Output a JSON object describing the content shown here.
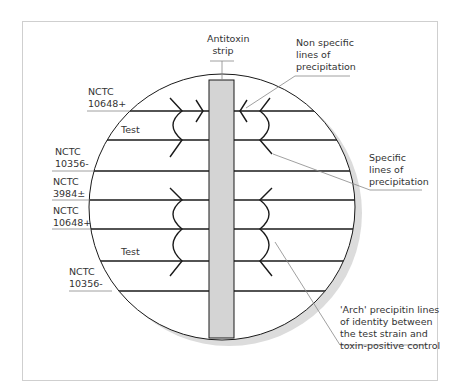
{
  "diagram": {
    "type": "immunodiffusion-plate",
    "strip_label": [
      "Antitoxin",
      "strip"
    ],
    "left_labels": [
      {
        "id": "nctc-10648-top",
        "lines": [
          "NCTC",
          "10648+"
        ]
      },
      {
        "id": "test-top",
        "lines": [
          "Test"
        ]
      },
      {
        "id": "nctc-10356-top",
        "lines": [
          "NCTC",
          "10356-"
        ]
      },
      {
        "id": "nctc-3984",
        "lines": [
          "NCTC",
          "3984±"
        ]
      },
      {
        "id": "nctc-10648-bottom",
        "lines": [
          "NCTC",
          "10648+"
        ]
      },
      {
        "id": "test-bottom",
        "lines": [
          "Test"
        ]
      },
      {
        "id": "nctc-10356-bottom",
        "lines": [
          "NCTC",
          "10356-"
        ]
      }
    ],
    "annotations": [
      {
        "id": "non-specific",
        "lines": [
          "Non specific",
          "lines of",
          "precipitation"
        ]
      },
      {
        "id": "specific",
        "lines": [
          "Specific",
          "lines of",
          "precipitation"
        ]
      },
      {
        "id": "arch",
        "lines": [
          "'Arch' precipitin lines",
          "of identity between",
          "the test strain and",
          "toxin-positive control"
        ]
      }
    ],
    "colors": {
      "strip_fill": "#d4d4d4",
      "shadow": "#dcdcdc",
      "line": "#1a1a1a",
      "leader": "#888888",
      "frame": "#cfcfcf"
    }
  }
}
